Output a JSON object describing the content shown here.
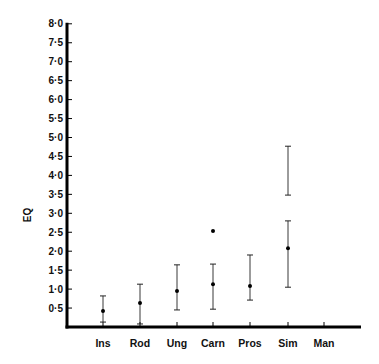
{
  "chart_data": {
    "type": "scatter",
    "title": "",
    "xlabel": "",
    "ylabel": "EQ",
    "ylim": [
      0,
      8.0
    ],
    "y_ticks": [
      "0·5",
      "1·0",
      "1·5",
      "2·0",
      "2·5",
      "3·0",
      "3·5",
      "4·0",
      "4·5",
      "5·0",
      "5·5",
      "6·0",
      "6·5",
      "7·0",
      "7·5",
      "8·0"
    ],
    "y_tick_values": [
      0.5,
      1.0,
      1.5,
      2.0,
      2.5,
      3.0,
      3.5,
      4.0,
      4.5,
      5.0,
      5.5,
      6.0,
      6.5,
      7.0,
      7.5,
      8.0
    ],
    "categories": [
      "Ins",
      "Rod",
      "Ung",
      "Carn",
      "Pros",
      "Sim",
      "Man"
    ],
    "grid": false,
    "legend": null,
    "series": [
      {
        "name": "mean EQ with range",
        "points": [
          {
            "category": "Ins",
            "mean": 0.42,
            "low": 0.13,
            "high": 0.82
          },
          {
            "category": "Rod",
            "mean": 0.63,
            "low": 0.08,
            "high": 1.13
          },
          {
            "category": "Ung",
            "mean": 0.95,
            "low": 0.45,
            "high": 1.64
          },
          {
            "category": "Carn",
            "mean": 1.13,
            "low": 0.47,
            "high": 1.66
          },
          {
            "category": "Pros",
            "mean": 1.08,
            "low": 0.71,
            "high": 1.9
          },
          {
            "category": "Sim",
            "mean": 2.08,
            "low": 1.05,
            "high": 2.8
          },
          {
            "category": "Man",
            "mean": null,
            "low": null,
            "high": null
          }
        ]
      },
      {
        "name": "outliers / separate ranges",
        "points": [
          {
            "category": "Carn",
            "value": 2.53,
            "kind": "point"
          },
          {
            "category": "Sim",
            "low": 3.48,
            "high": 4.77,
            "kind": "range"
          }
        ]
      }
    ]
  }
}
